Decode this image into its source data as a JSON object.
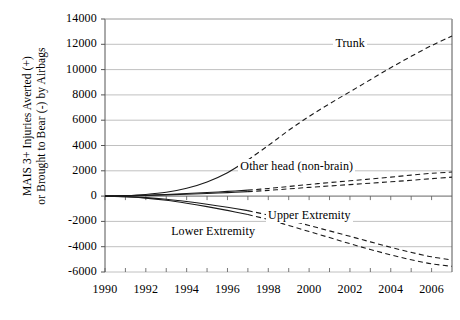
{
  "chart_data": {
    "type": "line",
    "title": "",
    "xlabel": "",
    "ylabel": "MAIS 3+ Injuries Averted (+)\nor Brought to Bear (-) by Airbags",
    "xlim": [
      1990,
      2007
    ],
    "ylim": [
      -6000,
      14000
    ],
    "xticks": [
      "1990",
      "1992",
      "1994",
      "1996",
      "1998",
      "2000",
      "2002",
      "2004",
      "2006"
    ],
    "xtick_values": [
      1990,
      1992,
      1994,
      1996,
      1998,
      2000,
      2002,
      2004,
      2006
    ],
    "yticks": [
      "14000",
      "12000",
      "10000",
      "8000",
      "6000",
      "4000",
      "2000",
      "0",
      "-2000",
      "-4000",
      "-6000"
    ],
    "ytick_values": [
      14000,
      12000,
      10000,
      8000,
      6000,
      4000,
      2000,
      0,
      -2000,
      -4000,
      -6000
    ],
    "grid": "horizontal",
    "legend_position": "inline-annotations",
    "line_color": "#1a1a1a",
    "grid_color": "#b0b0b0",
    "axis_color": "#555555",
    "solid_until": 1997,
    "x": [
      1990,
      1991,
      1992,
      1993,
      1994,
      1995,
      1996,
      1997,
      1998,
      1999,
      2000,
      2001,
      2002,
      2003,
      2004,
      2005,
      2006,
      2007
    ],
    "series": [
      {
        "name": "Trunk",
        "label": "Trunk",
        "label_x": 2002.0,
        "label_y": 12050,
        "values": [
          0,
          40,
          130,
          300,
          620,
          1120,
          1850,
          2850,
          4000,
          5200,
          6300,
          7300,
          8250,
          9200,
          10150,
          11050,
          11900,
          12650
        ]
      },
      {
        "name": "Other head (non-brain) upper",
        "label": "Other head (non-brain)",
        "label_x": 1999.4,
        "label_y": 2300,
        "values": [
          0,
          25,
          70,
          130,
          200,
          280,
          370,
          470,
          600,
          760,
          920,
          1070,
          1210,
          1350,
          1500,
          1660,
          1800,
          1900
        ]
      },
      {
        "name": "Other head (non-brain) lower",
        "label": "",
        "label_x": null,
        "label_y": null,
        "values": [
          0,
          18,
          50,
          95,
          150,
          210,
          275,
          350,
          450,
          570,
          690,
          800,
          910,
          1020,
          1130,
          1250,
          1380,
          1500
        ]
      },
      {
        "name": "Upper Extremity",
        "label": "Upper Extremity",
        "label_x": 2000.0,
        "label_y": -1550,
        "values": [
          0,
          -40,
          -120,
          -250,
          -430,
          -640,
          -880,
          -1150,
          -1500,
          -1900,
          -2320,
          -2750,
          -3180,
          -3620,
          -4050,
          -4450,
          -4800,
          -5050
        ]
      },
      {
        "name": "Lower Extremity",
        "label": "Lower Extremity",
        "label_x": 1995.3,
        "label_y": -2800,
        "values": [
          0,
          -55,
          -160,
          -330,
          -560,
          -830,
          -1130,
          -1460,
          -1850,
          -2320,
          -2800,
          -3280,
          -3760,
          -4220,
          -4650,
          -5030,
          -5350,
          -5550
        ]
      }
    ]
  }
}
